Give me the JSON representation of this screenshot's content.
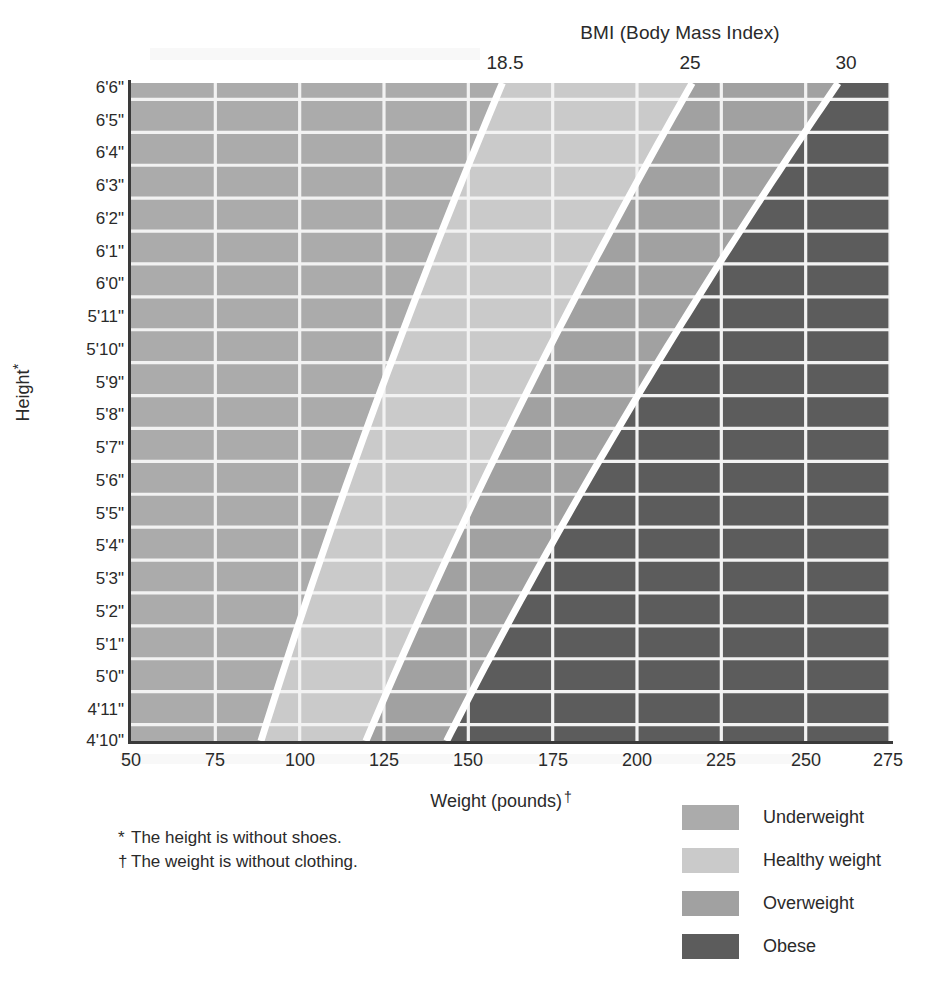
{
  "chart_data": {
    "type": "heatmap",
    "title": "BMI (Body Mass Index)",
    "xlabel": "Weight (pounds) †",
    "ylabel": "Height*",
    "xlim": [
      50,
      275
    ],
    "ylim_height_inches": [
      58,
      78
    ],
    "grid": true,
    "legend_position": "bottom-right",
    "x_ticks": [
      "50",
      "75",
      "100",
      "125",
      "150",
      "175",
      "200",
      "225",
      "250",
      "275"
    ],
    "x_tick_values": [
      50,
      75,
      100,
      125,
      150,
      175,
      200,
      225,
      250,
      275
    ],
    "y_ticks": [
      "6'6\"",
      "6'5\"",
      "6'4\"",
      "6'3\"",
      "6'2\"",
      "6'1\"",
      "6'0\"",
      "5'11\"",
      "5'10\"",
      "5'9\"",
      "5'8\"",
      "5'7\"",
      "5'6\"",
      "5'5\"",
      "5'4\"",
      "5'3\"",
      "5'2\"",
      "5'1\"",
      "5'0\"",
      "4'11\"",
      "4'10\""
    ],
    "y_tick_inches": [
      78,
      77,
      76,
      75,
      74,
      73,
      72,
      71,
      70,
      69,
      68,
      67,
      66,
      65,
      64,
      63,
      62,
      61,
      60,
      59,
      58
    ],
    "bmi_boundaries": [
      {
        "label": "18.5",
        "value": 18.5,
        "weight_at_4ft10": 88,
        "weight_at_6ft6": 160
      },
      {
        "label": "25",
        "value": 25,
        "weight_at_4ft10": 119,
        "weight_at_6ft6": 216
      },
      {
        "label": "30",
        "value": 30,
        "weight_at_4ft10": 143,
        "weight_at_6ft6": 259
      }
    ],
    "categories": [
      "Underweight",
      "Healthy weight",
      "Overweight",
      "Obese"
    ],
    "category_bmi_ranges": [
      {
        "name": "Underweight",
        "bmi_min": null,
        "bmi_max": 18.5
      },
      {
        "name": "Healthy weight",
        "bmi_min": 18.5,
        "bmi_max": 25
      },
      {
        "name": "Overweight",
        "bmi_min": 25,
        "bmi_max": 30
      },
      {
        "name": "Obese",
        "bmi_min": 30,
        "bmi_max": null
      }
    ],
    "colors": {
      "underweight": "#ababab",
      "healthy": "#cacaca",
      "overweight": "#a1a1a1",
      "obese": "#5c5c5c",
      "boundary_line": "#ffffff",
      "gridline": "#f2f2f2",
      "axis": "#3a3a3a"
    }
  },
  "top_axis": {
    "title": "BMI (Body Mass Index)",
    "ticks": [
      {
        "label": "18.5",
        "x": 505
      },
      {
        "label": "25",
        "x": 690
      },
      {
        "label": "30",
        "x": 846
      }
    ]
  },
  "x_axis": {
    "title_text": "Weight (pounds)",
    "title_dagger": "†",
    "ticks": [
      {
        "label": "50",
        "x": 131
      },
      {
        "label": "75",
        "x": 215
      },
      {
        "label": "100",
        "x": 300
      },
      {
        "label": "125",
        "x": 384
      },
      {
        "label": "150",
        "x": 468
      },
      {
        "label": "175",
        "x": 553
      },
      {
        "label": "200",
        "x": 637
      },
      {
        "label": "225",
        "x": 721
      },
      {
        "label": "250",
        "x": 806
      },
      {
        "label": "275",
        "x": 888
      }
    ]
  },
  "y_axis": {
    "title_text": "Height",
    "title_star": "*",
    "ticks": [
      {
        "label": "6'6\"",
        "y": 88
      },
      {
        "label": "6'5\"",
        "y": 121
      },
      {
        "label": "6'4\"",
        "y": 153
      },
      {
        "label": "6'3\"",
        "y": 186
      },
      {
        "label": "6'2\"",
        "y": 219
      },
      {
        "label": "6'1\"",
        "y": 252
      },
      {
        "label": "6'0\"",
        "y": 284
      },
      {
        "label": "5'11\"",
        "y": 317
      },
      {
        "label": "5'10\"",
        "y": 350
      },
      {
        "label": "5'9\"",
        "y": 383
      },
      {
        "label": "5'8\"",
        "y": 415
      },
      {
        "label": "5'7\"",
        "y": 448
      },
      {
        "label": "5'6\"",
        "y": 481
      },
      {
        "label": "5'5\"",
        "y": 514
      },
      {
        "label": "5'4\"",
        "y": 546
      },
      {
        "label": "5'3\"",
        "y": 579
      },
      {
        "label": "5'2\"",
        "y": 612
      },
      {
        "label": "5'1\"",
        "y": 645
      },
      {
        "label": "5'0\"",
        "y": 677
      },
      {
        "label": "4'11\"",
        "y": 710
      },
      {
        "label": "4'10\"",
        "y": 741
      }
    ]
  },
  "footnotes": [
    {
      "mark": "*",
      "text": "The height is without shoes."
    },
    {
      "mark": "†",
      "text": "The weight is without clothing."
    }
  ],
  "legend": {
    "items": [
      {
        "label": "Underweight",
        "color": "#ababab"
      },
      {
        "label": "Healthy weight",
        "color": "#cacaca"
      },
      {
        "label": "Overweight",
        "color": "#a1a1a1"
      },
      {
        "label": "Obese",
        "color": "#5c5c5c"
      }
    ]
  }
}
